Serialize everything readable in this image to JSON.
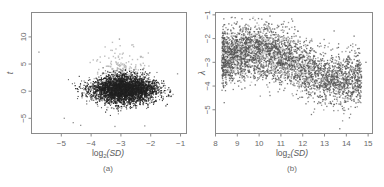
{
  "chart_data": [
    {
      "type": "scatter",
      "panel_label": "(a)",
      "xlabel": "log2(SD)",
      "ylabel": "t",
      "xlim": [
        -6.0,
        -0.8
      ],
      "ylim": [
        -7.8,
        14.5
      ],
      "xticks": [
        -5,
        -4,
        -3,
        -2,
        -1
      ],
      "yticks": [
        -5,
        0,
        5,
        10
      ],
      "grid": false,
      "legend": null,
      "series": [
        {
          "name": "main cluster (dark)",
          "color": "#222222",
          "n_points": 5000,
          "center": [
            -2.9,
            0.3
          ],
          "spread_x": 0.55,
          "spread_y": 1.4,
          "x_range": [
            -5.0,
            -1.1
          ],
          "y_range": [
            -4.5,
            6.0
          ]
        },
        {
          "name": "highlighted (light gray)",
          "color": "#b8b8b8",
          "n_points": 300,
          "center": [
            -3.0,
            2.5
          ],
          "spread_x": 0.45,
          "spread_y": 2.6,
          "x_range": [
            -4.3,
            -2.0
          ],
          "y_range": [
            -3.5,
            9.5
          ]
        }
      ],
      "outliers": [
        {
          "x": -5.75,
          "y": 7.2
        },
        {
          "x": -3.05,
          "y": 9.6
        },
        {
          "x": -4.9,
          "y": -5.0
        },
        {
          "x": -4.6,
          "y": -5.8
        },
        {
          "x": -4.35,
          "y": -6.3
        },
        {
          "x": -3.2,
          "y": -6.5
        },
        {
          "x": -2.2,
          "y": -6.4
        },
        {
          "x": -1.25,
          "y": -0.6
        },
        {
          "x": -1.1,
          "y": 3.2
        }
      ]
    },
    {
      "type": "scatter",
      "panel_label": "(b)",
      "xlabel": "log2(SD)",
      "ylabel": "λ",
      "xlim": [
        8.0,
        15.2
      ],
      "ylim": [
        -6.0,
        -0.9
      ],
      "xticks": [
        8,
        9,
        10,
        11,
        12,
        13,
        14,
        15
      ],
      "yticks": [
        -5,
        -4,
        -3,
        -2,
        -1
      ],
      "grid": false,
      "legend": null,
      "series": [
        {
          "name": "main cluster (gray)",
          "color": "#555555",
          "n_points": 3800,
          "trend": [
            {
              "x": 8.4,
              "y": -2.8
            },
            {
              "x": 9.5,
              "y": -2.5
            },
            {
              "x": 10.5,
              "y": -2.6
            },
            {
              "x": 11.5,
              "y": -2.9
            },
            {
              "x": 12.5,
              "y": -3.5
            },
            {
              "x": 13.5,
              "y": -3.8
            },
            {
              "x": 14.5,
              "y": -3.7
            }
          ],
          "spread_y": 0.55,
          "x_range": [
            8.3,
            14.7
          ]
        },
        {
          "name": "highlighted (light)",
          "color": "#d8d8d8",
          "n_points": 180,
          "x_range": [
            8.3,
            12.5
          ]
        }
      ],
      "outliers": [
        {
          "x": 8.4,
          "y": -4.7
        },
        {
          "x": 10.5,
          "y": -4.4
        },
        {
          "x": 10.5,
          "y": -1.05
        },
        {
          "x": 12.4,
          "y": -5.2
        },
        {
          "x": 13.7,
          "y": -5.8
        },
        {
          "x": 14.9,
          "y": -3.0
        },
        {
          "x": 12.8,
          "y": -2.2
        }
      ]
    }
  ],
  "panels": {
    "a": {
      "label": "(a)",
      "xlabel_base": "log",
      "xlabel_sub": "2",
      "xlabel_arg": "(SD)",
      "ylabel": "t",
      "xtick_labels": [
        "−5",
        "−4",
        "−3",
        "−2",
        "−1"
      ],
      "ytick_labels": [
        "−5",
        "0",
        "5",
        "10"
      ]
    },
    "b": {
      "label": "(b)",
      "xlabel_base": "log",
      "xlabel_sub": "2",
      "xlabel_arg": "(SD)",
      "ylabel": "λ",
      "xtick_labels": [
        "8",
        "9",
        "10",
        "11",
        "12",
        "13",
        "14",
        "15"
      ],
      "ytick_labels": [
        "−5",
        "−4",
        "−3",
        "−2",
        "−1"
      ]
    }
  }
}
